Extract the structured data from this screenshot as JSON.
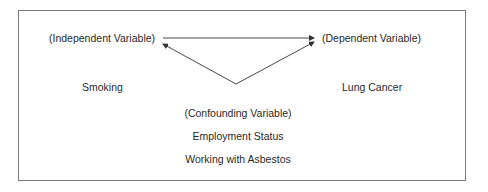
{
  "diagram": {
    "independent": {
      "role": "(Independent Variable)",
      "name": "Smoking"
    },
    "dependent": {
      "role": "(Dependent Variable)",
      "name": "Lung Cancer"
    },
    "confounding": {
      "role": "(Confounding Variable)",
      "examples": [
        "Employment Status",
        "Working with Asbestos"
      ]
    },
    "edges": [
      {
        "from": "independent",
        "to": "dependent",
        "type": "arrow"
      },
      {
        "from": "confounding",
        "to": "independent",
        "type": "arrow"
      },
      {
        "from": "confounding",
        "to": "dependent",
        "type": "arrow"
      }
    ],
    "colors": {
      "line": "#4a4a4a",
      "border": "#7a7a7a",
      "text": "#2a2a2a"
    }
  }
}
